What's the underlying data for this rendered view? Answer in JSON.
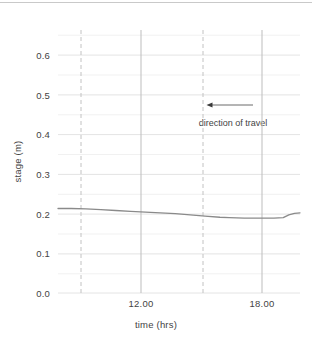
{
  "chart_data": {
    "type": "line",
    "title": "",
    "xlabel": "time (hrs)",
    "ylabel": "stage (m)",
    "xlim": [
      5.9,
      18.9
    ],
    "ylim": [
      0.0,
      0.65
    ],
    "xticks": [
      12.0,
      18.0
    ],
    "xtick_labels": [
      "12.00",
      "18.00"
    ],
    "yticks": [
      0.0,
      0.1,
      0.2,
      0.3,
      0.4,
      0.5,
      0.6
    ],
    "ytick_labels": [
      "0.0",
      "0.1",
      "0.2",
      "0.3",
      "0.4",
      "0.5",
      "0.6"
    ],
    "y_minor_ticks": [
      0.05,
      0.15,
      0.25,
      0.35,
      0.45,
      0.55,
      0.65
    ],
    "grid": "horizontal-major-and-minor",
    "legend": "none",
    "series": [
      {
        "name": "stage",
        "color": "#8a8a8a",
        "x": [
          5.9,
          6.6,
          7.4,
          8.2,
          9.0,
          9.8,
          10.6,
          11.4,
          12.2,
          13.0,
          13.8,
          14.6,
          15.1,
          15.9,
          16.7,
          17.5,
          18.0,
          18.3,
          18.6,
          18.9
        ],
        "y": [
          0.213,
          0.213,
          0.212,
          0.21,
          0.208,
          0.206,
          0.204,
          0.202,
          0.2,
          0.197,
          0.194,
          0.191,
          0.19,
          0.189,
          0.189,
          0.189,
          0.19,
          0.197,
          0.201,
          0.202
        ]
      }
    ],
    "vlines": [
      {
        "name": "dashed-marker-1",
        "x": 9.0,
        "style": "dashed",
        "color": "#c0c0c0"
      },
      {
        "name": "dashed-marker-2",
        "x": 15.1,
        "style": "dashed",
        "color": "#c0c0c0"
      },
      {
        "name": "solid-tick-12",
        "x": 12.0,
        "style": "solid",
        "color": "#bdbdbd"
      },
      {
        "name": "solid-tick-18",
        "x": 18.0,
        "style": "solid",
        "color": "#bdbdbd"
      }
    ],
    "annotations": [
      {
        "name": "direction-of-travel",
        "text": "direction of travel",
        "arrow": {
          "from_x": 15.7,
          "to_x": 13.4,
          "y": 0.473,
          "direction": "left"
        }
      }
    ],
    "colors": {
      "line": "#8a8a8a",
      "grid_major": "#e6e6e6",
      "grid_minor": "#f0f0f0",
      "axis_text": "#434343",
      "dashed": "#c0c0c0",
      "background": "#ffffff"
    }
  }
}
